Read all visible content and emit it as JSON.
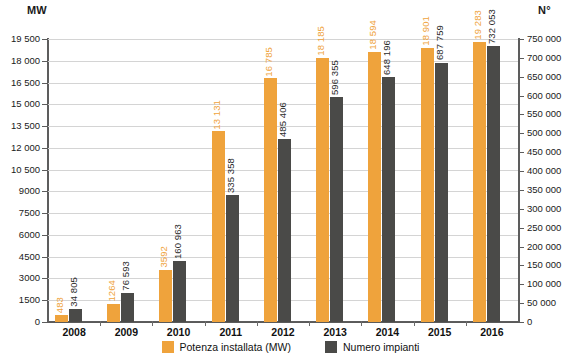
{
  "chart_data": {
    "type": "bar",
    "title": "",
    "subtitle": "",
    "xlabel": "",
    "categories": [
      "2008",
      "2009",
      "2010",
      "2011",
      "2012",
      "2013",
      "2014",
      "2015",
      "2016"
    ],
    "series": [
      {
        "name": "Potenza installata (MW)",
        "axis": "left",
        "color": "#efa33c",
        "values": [
          483,
          1264,
          3592,
          13131,
          16785,
          18185,
          18594,
          18901,
          19283
        ],
        "labels": [
          "483",
          "1264",
          "3592",
          "13 131",
          "16 785",
          "18 185",
          "18 594",
          "18 901",
          "19 283"
        ]
      },
      {
        "name": "Numero impianti",
        "axis": "right",
        "color": "#4a4a48",
        "values": [
          34805,
          76593,
          160963,
          335358,
          485406,
          596355,
          648196,
          687759,
          732053
        ],
        "labels": [
          "34 805",
          "76 593",
          "160 963",
          "335 358",
          "485 406",
          "596 355",
          "648 196",
          "687 759",
          "732 053"
        ]
      }
    ],
    "left_axis": {
      "header": "MW",
      "ylabel": "MW",
      "ylim": [
        0,
        19500
      ],
      "step": 1500,
      "ticks": [
        0,
        1500,
        3000,
        4500,
        6000,
        7500,
        9000,
        10500,
        12000,
        13500,
        15000,
        16500,
        18000,
        19500
      ],
      "tick_labels": [
        "0",
        "1500",
        "3000",
        "4500",
        "6000",
        "7500",
        "9000",
        "10 500",
        "12 000",
        "13 500",
        "15 000",
        "16 500",
        "18 000",
        "19 500"
      ]
    },
    "right_axis": {
      "header": "N°",
      "ylabel": "N°",
      "ylim": [
        0,
        750000
      ],
      "step": 50000,
      "ticks": [
        0,
        50000,
        100000,
        150000,
        200000,
        250000,
        300000,
        350000,
        400000,
        450000,
        500000,
        550000,
        600000,
        650000,
        700000,
        750000
      ],
      "tick_labels": [
        "0",
        "50 000",
        "100 000",
        "150 000",
        "200 000",
        "250 000",
        "300 000",
        "350 000",
        "400 000",
        "450 000",
        "500 000",
        "550 000",
        "600 000",
        "650 000",
        "700 000",
        "750 000"
      ]
    },
    "grid": true,
    "legend_position": "bottom"
  },
  "legend": {
    "items": [
      {
        "label": "Potenza installata (MW)",
        "color": "#efa33c"
      },
      {
        "label": "Numero impianti",
        "color": "#4a4a48"
      }
    ]
  }
}
